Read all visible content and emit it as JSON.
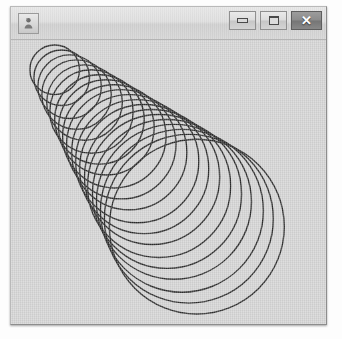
{
  "window": {
    "title": "",
    "icon_name": "java-app-icon",
    "frame_color": "#8d8d8d",
    "titlebar_color": "#dedede",
    "canvas_color": "#d3d3d3",
    "controls": [
      {
        "name": "minimize-button",
        "label": "—",
        "glyph": "minimize"
      },
      {
        "name": "maximize-button",
        "label": "□",
        "glyph": "maximize"
      },
      {
        "name": "close-button",
        "label": "✕",
        "glyph": "close"
      }
    ]
  },
  "chart_data": {
    "type": "scatter",
    "title": "",
    "subtitle": "",
    "xlabel": "",
    "ylabel": "",
    "stroke_color": "#2b2b2b",
    "stroke_width": 1.4,
    "fill": "none",
    "grid": false,
    "legend": null,
    "xlim": [
      0,
      317
    ],
    "ylim": [
      0,
      286
    ],
    "circle_count": 20,
    "center_start": [
      44,
      30
    ],
    "center_end": [
      187,
      188
    ],
    "radius_start": 25,
    "radius_end": 88,
    "circles": [
      {
        "cx": 44,
        "cy": 30,
        "r": 25
      },
      {
        "cx": 51,
        "cy": 38,
        "r": 28
      },
      {
        "cx": 59,
        "cy": 47,
        "r": 32
      },
      {
        "cx": 66,
        "cy": 55,
        "r": 35
      },
      {
        "cx": 74,
        "cy": 63,
        "r": 38
      },
      {
        "cx": 81,
        "cy": 72,
        "r": 42
      },
      {
        "cx": 89,
        "cy": 80,
        "r": 45
      },
      {
        "cx": 96,
        "cy": 88,
        "r": 48
      },
      {
        "cx": 104,
        "cy": 97,
        "r": 52
      },
      {
        "cx": 111,
        "cy": 105,
        "r": 55
      },
      {
        "cx": 119,
        "cy": 113,
        "r": 58
      },
      {
        "cx": 127,
        "cy": 122,
        "r": 62
      },
      {
        "cx": 134,
        "cy": 130,
        "r": 65
      },
      {
        "cx": 142,
        "cy": 138,
        "r": 68
      },
      {
        "cx": 149,
        "cy": 147,
        "r": 72
      },
      {
        "cx": 157,
        "cy": 155,
        "r": 75
      },
      {
        "cx": 164,
        "cy": 163,
        "r": 78
      },
      {
        "cx": 172,
        "cy": 172,
        "r": 82
      },
      {
        "cx": 179,
        "cy": 180,
        "r": 85
      },
      {
        "cx": 187,
        "cy": 188,
        "r": 88
      }
    ]
  }
}
